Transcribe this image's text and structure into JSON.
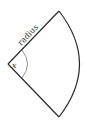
{
  "diagram": {
    "type": "circular-sector",
    "labels": {
      "side": "radius",
      "angle": "x"
    },
    "colors": {
      "stroke": "#2b2b2b",
      "angle_arc": "#7a7a7a",
      "background": "#ffffff"
    }
  }
}
